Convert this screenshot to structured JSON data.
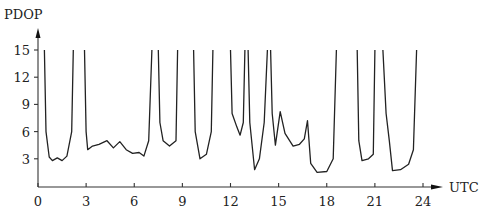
{
  "chart_data": {
    "type": "line",
    "title": "",
    "xlabel": "UTC",
    "ylabel": "PDOP",
    "x_ticks": [
      "0",
      "3",
      "6",
      "9",
      "12",
      "15",
      "18",
      "21",
      "24"
    ],
    "y_ticks": [
      "3",
      "6",
      "9",
      "12",
      "15"
    ],
    "xlim": [
      0,
      24
    ],
    "ylim": [
      0,
      15
    ],
    "grid": false,
    "legend": null,
    "series": [
      {
        "name": "PDOP",
        "note": "values above 15 are clipped at the top of the plot",
        "points": [
          [
            0.4,
            15
          ],
          [
            0.5,
            6
          ],
          [
            0.7,
            3.2
          ],
          [
            0.9,
            2.8
          ],
          [
            1.2,
            3.1
          ],
          [
            1.5,
            2.8
          ],
          [
            1.8,
            3.3
          ],
          [
            2.1,
            6
          ],
          [
            2.2,
            15
          ],
          [
            2.9,
            15
          ],
          [
            3.0,
            6
          ],
          [
            3.1,
            4.0
          ],
          [
            3.4,
            4.4
          ],
          [
            3.8,
            4.6
          ],
          [
            4.3,
            5.0
          ],
          [
            4.7,
            4.2
          ],
          [
            5.1,
            4.9
          ],
          [
            5.5,
            4.0
          ],
          [
            5.9,
            3.6
          ],
          [
            6.3,
            3.7
          ],
          [
            6.6,
            3.3
          ],
          [
            6.9,
            5
          ],
          [
            7.1,
            15
          ],
          [
            7.5,
            15
          ],
          [
            7.6,
            7
          ],
          [
            7.8,
            5
          ],
          [
            8.2,
            4.4
          ],
          [
            8.6,
            5
          ],
          [
            8.7,
            15
          ],
          [
            9.7,
            15
          ],
          [
            9.8,
            6
          ],
          [
            10.1,
            3.0
          ],
          [
            10.5,
            3.5
          ],
          [
            10.8,
            6
          ],
          [
            10.9,
            15
          ],
          [
            12.0,
            15
          ],
          [
            12.1,
            8
          ],
          [
            12.4,
            6.5
          ],
          [
            12.6,
            5.6
          ],
          [
            12.8,
            7
          ],
          [
            12.9,
            15
          ],
          [
            13.1,
            15
          ],
          [
            13.2,
            7
          ],
          [
            13.5,
            1.8
          ],
          [
            13.8,
            3
          ],
          [
            14.1,
            7
          ],
          [
            14.3,
            15
          ],
          [
            14.5,
            15
          ],
          [
            14.6,
            8
          ],
          [
            14.8,
            4.5
          ],
          [
            15.1,
            8.2
          ],
          [
            15.4,
            5.8
          ],
          [
            15.9,
            4.4
          ],
          [
            16.3,
            4.6
          ],
          [
            16.6,
            5.2
          ],
          [
            16.8,
            7.2
          ],
          [
            17.0,
            2.5
          ],
          [
            17.4,
            1.5
          ],
          [
            18.0,
            1.6
          ],
          [
            18.4,
            3
          ],
          [
            18.6,
            15
          ],
          [
            19.9,
            15
          ],
          [
            20.0,
            5
          ],
          [
            20.2,
            2.8
          ],
          [
            20.6,
            3.0
          ],
          [
            20.9,
            3.5
          ],
          [
            21.0,
            15
          ],
          [
            21.5,
            15
          ],
          [
            21.7,
            8
          ],
          [
            21.9,
            5
          ],
          [
            22.1,
            1.7
          ],
          [
            22.6,
            1.8
          ],
          [
            23.1,
            2.4
          ],
          [
            23.4,
            4
          ],
          [
            23.6,
            15
          ]
        ]
      }
    ]
  }
}
